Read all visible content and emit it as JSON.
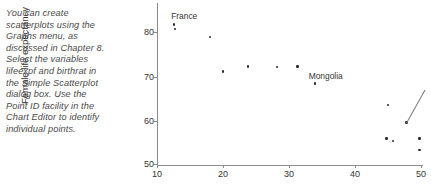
{
  "prose": {
    "text": "You can create scatterplots using the Graphs menu, as discussed in Chapter 8. Select the variables lifeexpf and birthrat in the Simple Scatterplot dialog box. Use the Point ID facility in the Chart Editor to identify individual points."
  },
  "chart_data": {
    "type": "scatter",
    "title": "",
    "xlabel": "",
    "ylabel": "Female life expectancy",
    "xlim": [
      8,
      52
    ],
    "ylim": [
      49,
      84
    ],
    "xticks": [
      10,
      20,
      30,
      40,
      50
    ],
    "yticks": [
      50,
      60,
      70,
      80
    ],
    "grid": false,
    "legend": null,
    "series": [
      {
        "name": "countries",
        "points": [
          {
            "x": 12.6,
            "y": 81.7,
            "label": "France"
          },
          {
            "x": 12.7,
            "y": 80.7,
            "label": null
          },
          {
            "x": 18.0,
            "y": 78.9,
            "label": null
          },
          {
            "x": 23.8,
            "y": 72.2,
            "label": null
          },
          {
            "x": 28.2,
            "y": 72.1,
            "label": null
          },
          {
            "x": 31.3,
            "y": 72.2,
            "label": null
          },
          {
            "x": 20.0,
            "y": 71.0,
            "label": null
          },
          {
            "x": 33.9,
            "y": 68.3,
            "label": "Mongolia"
          },
          {
            "x": 45.0,
            "y": 63.4,
            "label": null
          },
          {
            "x": 47.8,
            "y": 59.4,
            "label": null
          },
          {
            "x": 44.8,
            "y": 55.8,
            "label": null
          },
          {
            "x": 45.8,
            "y": 55.2,
            "label": null
          },
          {
            "x": 49.8,
            "y": 55.8,
            "label": null
          },
          {
            "x": 49.8,
            "y": 53.2,
            "label": null
          }
        ]
      }
    ],
    "annotations": [
      {
        "text": "France",
        "x": 12.6,
        "y": 81.7,
        "placement": "above"
      },
      {
        "text": "Mongolia",
        "x": 33.9,
        "y": 68.3,
        "placement": "right"
      },
      {
        "text": "",
        "x": 47.8,
        "y": 59.4,
        "placement": "leader-line-upper-right"
      }
    ]
  },
  "axis_labels": {
    "y": "Female life expectancy"
  },
  "tick_labels": {
    "x": [
      "10",
      "20",
      "30",
      "40",
      "50"
    ],
    "y": [
      "80",
      "70",
      "60",
      "50"
    ]
  },
  "point_labels": {
    "france": "France",
    "mongolia": "Mongolia"
  },
  "colors": {
    "point": "#2b2b2b",
    "axis": "#8c8c8c",
    "text": "#333333",
    "prose": "#4a4a4a",
    "background": "#ffffff"
  }
}
